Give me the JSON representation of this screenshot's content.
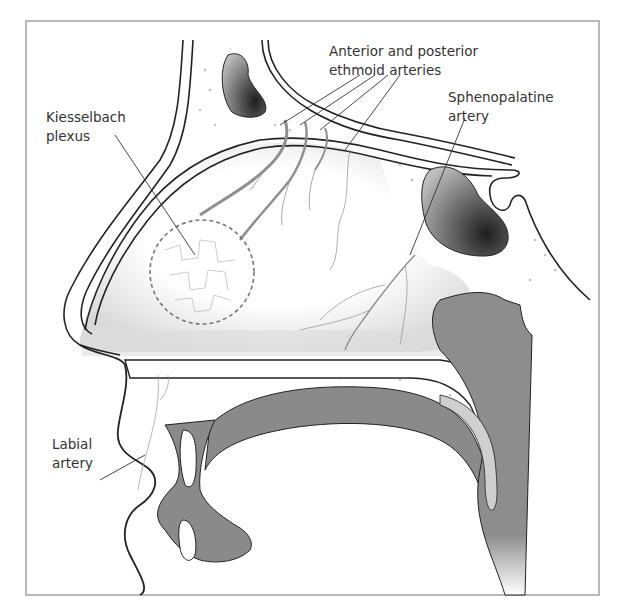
{
  "figure": {
    "type": "anatomical-illustration",
    "colors": {
      "frame": "#b8b8b8",
      "outline": "#222222",
      "tissue_dark": "#8a8a8a",
      "tissue_mid": "#c8c8c8",
      "mucosa_light": "#e6e6e6",
      "vessel": "#999999",
      "label_text": "#333333"
    }
  },
  "labels": {
    "ethmoid": {
      "line1": "Anterior and posterior",
      "line2": "ethmoid arteries"
    },
    "kiesselbach": {
      "line1": "Kiesselbach",
      "line2": "plexus"
    },
    "sphenopalatine": {
      "line1": "Sphenopalatine",
      "line2": "artery"
    },
    "labial": {
      "line1": "Labial",
      "line2": "artery"
    }
  }
}
